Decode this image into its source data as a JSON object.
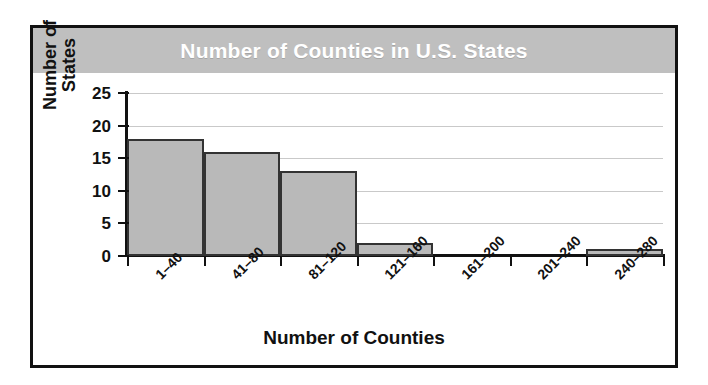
{
  "figure": {
    "title": "Number of Counties in U.S. States",
    "border_color": "#111111",
    "banner_color": "#bfbfbf",
    "title_color": "#ffffff"
  },
  "chart_data": {
    "type": "bar",
    "title": "Number of Counties in U.S. States",
    "xlabel": "Number of Counties",
    "ylabel": "Number of States",
    "ylabel_line1": "Number of",
    "ylabel_line2": "States",
    "categories": [
      "1–40",
      "41–80",
      "81–120",
      "121–160",
      "161–200",
      "201–240",
      "240–280"
    ],
    "values": [
      18,
      16,
      13,
      2,
      0,
      0,
      1
    ],
    "ylim": [
      0,
      25
    ],
    "yticks": [
      0,
      5,
      10,
      15,
      20,
      25
    ],
    "ytick_labels": [
      "0",
      "5",
      "10",
      "15",
      "20",
      "25"
    ],
    "grid": true,
    "grid_axis": "y",
    "grid_color": "#c9c9c9",
    "legend": "none",
    "bar_fill": "#b9b9b9",
    "bar_edge": "#333333",
    "bar_gap": 0
  }
}
